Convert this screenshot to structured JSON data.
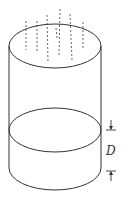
{
  "diagram": {
    "type": "cylinder-rain-gauge",
    "labels": {
      "depth": "D"
    },
    "colors": {
      "stroke": "#333333",
      "rain": "#555555",
      "background": "#ffffff"
    },
    "rain_streaks": 7
  }
}
